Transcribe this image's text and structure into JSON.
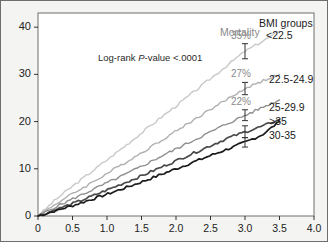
{
  "figure": {
    "background": "#f4f4f2",
    "plot_background": "#ffffff",
    "frame_color": "#6e6e6e"
  },
  "annotations": {
    "logrank_prefix": "Log-rank ",
    "logrank_italic": "P",
    "logrank_suffix": "-value <.0001",
    "mortality_label": "Mortality"
  },
  "legend": {
    "title": "BMI groups",
    "items": [
      {
        "label": "<22.5",
        "color": "#c9c9c9"
      },
      {
        "label": "22.5-24.9",
        "color": "#b0b0b0"
      },
      {
        "label": "25-29.9",
        "color": "#8f8f8f"
      },
      {
        "label": ">35",
        "color": "#4a4a4a"
      },
      {
        "label": "30-35",
        "color": "#1c1c1c"
      }
    ]
  },
  "chart_data": {
    "type": "line",
    "title": "",
    "xlabel": "",
    "ylabel": "",
    "xlim": [
      0,
      4.0
    ],
    "ylim": [
      0,
      43
    ],
    "grid": false,
    "legend_position": "right",
    "xticks": [
      "0",
      "0.5",
      "1.0",
      "1.5",
      "2.0",
      "2.5",
      "3.0",
      "3.5",
      "4.0"
    ],
    "xtick_values": [
      0,
      0.5,
      1.0,
      1.5,
      2.0,
      2.5,
      3.0,
      3.5,
      4.0
    ],
    "yticks": [
      "0",
      "10",
      "20",
      "30",
      "40"
    ],
    "ytick_values": [
      0,
      10,
      20,
      30,
      40
    ],
    "x": [
      0,
      0.25,
      0.5,
      0.75,
      1.0,
      1.25,
      1.5,
      1.75,
      2.0,
      2.25,
      2.5,
      2.75,
      3.0,
      3.25,
      3.5
    ],
    "series": [
      {
        "name": "<22.5",
        "color": "#c9c9c9",
        "width": 1.4,
        "values": [
          0,
          3.4,
          6.3,
          9.1,
          11.9,
          14.7,
          17.6,
          20.5,
          23.3,
          26.2,
          29.1,
          32.0,
          34.9,
          37.0,
          39.1
        ],
        "endpoint_pct": 39.1
      },
      {
        "name": "22.5-24.9",
        "color": "#b0b0b0",
        "width": 1.4,
        "values": [
          0,
          2.5,
          4.7,
          6.8,
          9.0,
          11.2,
          13.4,
          15.7,
          18.0,
          20.3,
          22.6,
          24.8,
          27.0,
          28.6,
          30.0
        ],
        "endpoint_pct": 30.0
      },
      {
        "name": "25-29.9",
        "color": "#8f8f8f",
        "width": 1.4,
        "values": [
          0,
          1.9,
          3.6,
          5.3,
          7.0,
          8.7,
          10.5,
          12.4,
          14.2,
          16.0,
          17.8,
          19.6,
          21.3,
          23.0,
          24.6
        ],
        "endpoint_pct": 24.6
      },
      {
        "name": ">35",
        "color": "#4a4a4a",
        "width": 1.7,
        "values": [
          0,
          1.3,
          2.6,
          4.0,
          5.5,
          7.0,
          8.5,
          10.1,
          11.7,
          13.3,
          14.9,
          16.5,
          17.8,
          19.0,
          20.4
        ],
        "endpoint_pct": 20.4
      },
      {
        "name": "30-35",
        "color": "#1c1c1c",
        "width": 1.7,
        "values": [
          0,
          1.1,
          2.2,
          3.4,
          4.6,
          5.9,
          7.2,
          8.6,
          10.0,
          11.4,
          12.8,
          14.2,
          15.6,
          17.2,
          20.0
        ],
        "endpoint_pct": 20.0
      }
    ],
    "error_bars": [
      {
        "series": "<22.5",
        "x": 3.0,
        "y": 34.9,
        "low": 33.3,
        "high": 36.5,
        "label": "35%"
      },
      {
        "series": "22.5-24.9",
        "x": 3.0,
        "y": 27.0,
        "low": 25.7,
        "high": 28.3,
        "label": "27%"
      },
      {
        "series": "25-29.9",
        "x": 3.0,
        "y": 21.3,
        "low": 20.2,
        "high": 22.5,
        "label": "22%"
      },
      {
        "series": ">35",
        "x": 3.0,
        "y": 17.8,
        "low": 16.6,
        "high": 19.1,
        "label": ""
      },
      {
        "series": "30-35",
        "x": 3.0,
        "y": 15.6,
        "low": 14.6,
        "high": 16.6,
        "label": ""
      }
    ]
  }
}
